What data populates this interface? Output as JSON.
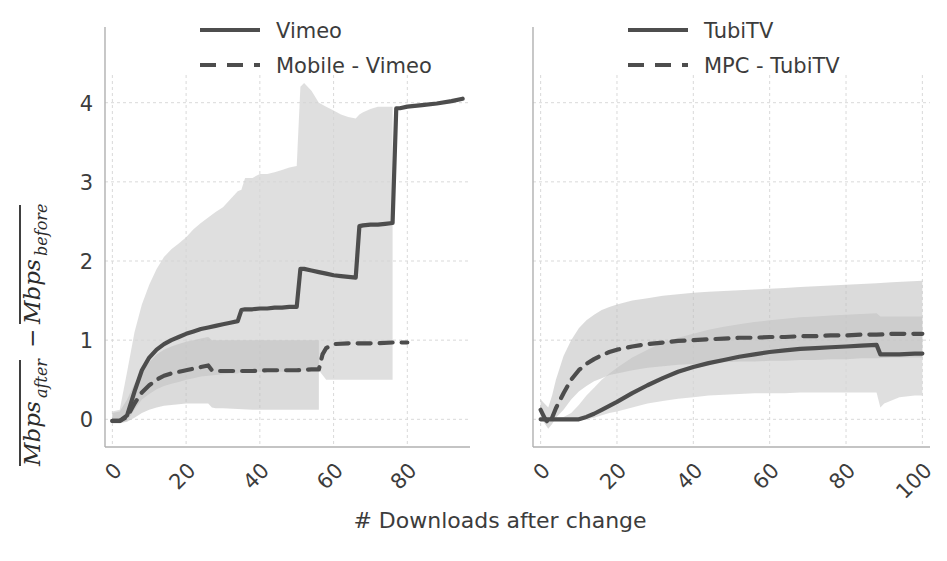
{
  "figure": {
    "background_color": "#ffffff",
    "panels": 2,
    "xlabel": "# Downloads after change",
    "ylabel_parts": {
      "term1_base": "Mbps",
      "term1_sub": "after",
      "operator": "−",
      "term2_base": "Mbps",
      "term2_sub": "before",
      "overline": true
    },
    "ylabel_plain": "Mbps_after - Mbps_before"
  },
  "style": {
    "line_color": "#4d4d4d",
    "band_color": "#d4d4d4",
    "band_color_dark": "#bdbdbd",
    "grid_color": "#d9d9d9",
    "spine_color": "#b0b0b0",
    "text_color": "#3c3c3c"
  },
  "chart_data": [
    {
      "type": "line",
      "panel": "left",
      "title": "",
      "xlabel": "# Downloads after change",
      "ylabel": "Mbps_after - Mbps_before",
      "xlim": [
        -2,
        97
      ],
      "ylim": [
        -0.35,
        4.35
      ],
      "xticks": [
        0,
        20,
        40,
        60,
        80
      ],
      "yticks": [
        0,
        1,
        2,
        3,
        4
      ],
      "xticklabels": [
        "0",
        "20",
        "40",
        "60",
        "80"
      ],
      "yticklabels": [
        "0",
        "1",
        "2",
        "3",
        "4"
      ],
      "grid": true,
      "legend_position": "upper left",
      "series": [
        {
          "name": "Vimeo",
          "style": "solid",
          "color": "#4d4d4d",
          "x": [
            0,
            2,
            4,
            6,
            8,
            10,
            12,
            14,
            16,
            18,
            20,
            22,
            24,
            26,
            28,
            30,
            32,
            34,
            35,
            36,
            38,
            40,
            42,
            44,
            46,
            48,
            50,
            51,
            52,
            54,
            56,
            58,
            60,
            62,
            64,
            66,
            67,
            68,
            70,
            72,
            74,
            76,
            77,
            78,
            80,
            84,
            88,
            92,
            95
          ],
          "y": [
            -0.02,
            -0.02,
            0.05,
            0.35,
            0.62,
            0.78,
            0.88,
            0.95,
            1.0,
            1.04,
            1.08,
            1.11,
            1.14,
            1.16,
            1.18,
            1.2,
            1.22,
            1.24,
            1.38,
            1.39,
            1.39,
            1.4,
            1.4,
            1.41,
            1.41,
            1.42,
            1.42,
            1.9,
            1.9,
            1.88,
            1.86,
            1.84,
            1.82,
            1.81,
            1.8,
            1.79,
            2.44,
            2.45,
            2.46,
            2.46,
            2.47,
            2.48,
            3.93,
            3.93,
            3.95,
            3.97,
            3.99,
            4.02,
            4.05
          ],
          "band_lower": [
            -0.05,
            -0.05,
            -0.02,
            0.12,
            0.25,
            0.32,
            0.38,
            0.42,
            0.45,
            0.47,
            0.5,
            0.52,
            0.54,
            0.55,
            0.56,
            0.57,
            0.58,
            0.58,
            0.6,
            0.6,
            0.6,
            0.6,
            0.6,
            0.6,
            0.6,
            0.6,
            0.6,
            0.62,
            0.62,
            0.62,
            0.62,
            0.5,
            0.5,
            0.5,
            0.5,
            0.5,
            0.5,
            0.5,
            0.5,
            0.5,
            0.5,
            0.5,
            null,
            null,
            null,
            null,
            null,
            null,
            null
          ],
          "band_upper": [
            0.1,
            0.12,
            0.6,
            1.1,
            1.45,
            1.7,
            1.9,
            2.05,
            2.15,
            2.22,
            2.3,
            2.4,
            2.48,
            2.55,
            2.62,
            2.68,
            2.78,
            2.88,
            2.9,
            3.05,
            3.05,
            3.1,
            3.1,
            3.12,
            3.15,
            3.18,
            3.2,
            4.2,
            4.25,
            4.15,
            4.0,
            3.95,
            3.9,
            3.85,
            3.82,
            3.8,
            3.85,
            3.88,
            3.92,
            3.95,
            3.95,
            3.95,
            null,
            null,
            null,
            null,
            null,
            null,
            null
          ]
        },
        {
          "name": "Mobile - Vimeo",
          "style": "dashed",
          "color": "#4d4d4d",
          "x": [
            0,
            2,
            4,
            6,
            8,
            10,
            12,
            14,
            16,
            18,
            20,
            22,
            24,
            26,
            27,
            28,
            30,
            34,
            38,
            42,
            46,
            50,
            54,
            56,
            57,
            58,
            60,
            64,
            68,
            72,
            76,
            80
          ],
          "y": [
            -0.02,
            -0.02,
            0.03,
            0.2,
            0.34,
            0.43,
            0.5,
            0.55,
            0.58,
            0.6,
            0.62,
            0.64,
            0.66,
            0.68,
            0.62,
            0.61,
            0.61,
            0.61,
            0.61,
            0.62,
            0.62,
            0.62,
            0.63,
            0.63,
            0.82,
            0.9,
            0.95,
            0.96,
            0.96,
            0.96,
            0.97,
            0.97
          ],
          "band_lower": [
            -0.05,
            -0.05,
            -0.03,
            0.02,
            0.08,
            0.12,
            0.15,
            0.17,
            0.18,
            0.19,
            0.2,
            0.2,
            0.2,
            0.2,
            0.15,
            0.14,
            0.14,
            0.13,
            0.12,
            0.12,
            0.12,
            0.12,
            0.12,
            0.12,
            null,
            null,
            null,
            null,
            null,
            null,
            null,
            null
          ],
          "band_upper": [
            0.08,
            0.1,
            0.25,
            0.45,
            0.6,
            0.72,
            0.82,
            0.88,
            0.92,
            0.95,
            0.98,
            1.0,
            1.02,
            1.04,
            1.0,
            1.0,
            1.0,
            1.0,
            1.0,
            1.0,
            1.0,
            1.0,
            1.0,
            1.0,
            null,
            null,
            null,
            null,
            null,
            null,
            null,
            null
          ]
        }
      ]
    },
    {
      "type": "line",
      "panel": "right",
      "title": "",
      "xlabel": "# Downloads after change",
      "ylabel": "Mbps_after - Mbps_before",
      "xlim": [
        -2,
        102
      ],
      "ylim": [
        -0.35,
        4.35
      ],
      "xticks": [
        0,
        20,
        40,
        60,
        80,
        100
      ],
      "yticks": [
        0,
        1,
        2,
        3,
        4
      ],
      "xticklabels": [
        "0",
        "20",
        "40",
        "60",
        "80",
        "100"
      ],
      "yticklabels": [
        "0",
        "1",
        "2",
        "3",
        "4"
      ],
      "grid": true,
      "legend_position": "upper left",
      "series": [
        {
          "name": "TubiTV",
          "style": "solid",
          "color": "#4d4d4d",
          "x": [
            0,
            2,
            4,
            6,
            8,
            10,
            12,
            14,
            16,
            18,
            20,
            24,
            28,
            32,
            36,
            40,
            44,
            48,
            52,
            56,
            60,
            64,
            68,
            72,
            76,
            80,
            84,
            88,
            89,
            90,
            94,
            98,
            100
          ],
          "y": [
            0.0,
            0.0,
            0.0,
            0.0,
            0.0,
            0.0,
            0.03,
            0.07,
            0.12,
            0.17,
            0.22,
            0.33,
            0.43,
            0.52,
            0.6,
            0.66,
            0.71,
            0.75,
            0.79,
            0.82,
            0.85,
            0.87,
            0.89,
            0.9,
            0.91,
            0.92,
            0.93,
            0.94,
            0.82,
            0.82,
            0.82,
            0.83,
            0.83
          ],
          "band_lower": [
            0.0,
            -0.02,
            -0.02,
            -0.02,
            -0.02,
            -0.02,
            0.0,
            0.02,
            0.05,
            0.08,
            0.1,
            0.15,
            0.2,
            0.23,
            0.26,
            0.28,
            0.3,
            0.31,
            0.32,
            0.33,
            0.33,
            0.33,
            0.34,
            0.34,
            0.34,
            0.34,
            0.34,
            0.34,
            0.15,
            0.2,
            0.28,
            0.3,
            0.3
          ],
          "band_upper": [
            0.02,
            0.02,
            0.02,
            0.03,
            0.08,
            0.18,
            0.3,
            0.4,
            0.5,
            0.58,
            0.65,
            0.78,
            0.88,
            0.97,
            1.03,
            1.08,
            1.13,
            1.17,
            1.2,
            1.23,
            1.25,
            1.27,
            1.29,
            1.3,
            1.31,
            1.32,
            1.33,
            1.34,
            1.3,
            1.3,
            1.3,
            1.3,
            1.3
          ]
        },
        {
          "name": "MPC - TubiTV",
          "style": "dashed",
          "color": "#4d4d4d",
          "x": [
            0,
            1,
            2,
            3,
            4,
            6,
            8,
            10,
            12,
            14,
            16,
            18,
            20,
            24,
            28,
            32,
            36,
            40,
            44,
            48,
            52,
            56,
            60,
            64,
            68,
            72,
            76,
            80,
            84,
            88,
            92,
            96,
            100
          ],
          "y": [
            0.12,
            0.02,
            -0.05,
            0.02,
            0.14,
            0.33,
            0.5,
            0.62,
            0.7,
            0.76,
            0.81,
            0.85,
            0.88,
            0.92,
            0.95,
            0.97,
            0.99,
            1.0,
            1.01,
            1.02,
            1.03,
            1.03,
            1.04,
            1.04,
            1.05,
            1.05,
            1.06,
            1.06,
            1.07,
            1.07,
            1.08,
            1.08,
            1.08
          ],
          "band_lower": [
            0.02,
            -0.05,
            -0.12,
            -0.06,
            0.02,
            0.12,
            0.25,
            0.35,
            0.42,
            0.48,
            0.52,
            0.56,
            0.58,
            0.62,
            0.65,
            0.67,
            0.69,
            0.7,
            0.71,
            0.72,
            0.73,
            0.73,
            0.74,
            0.74,
            0.75,
            0.75,
            0.76,
            0.76,
            0.77,
            0.77,
            0.78,
            0.78,
            0.78
          ],
          "band_upper": [
            0.25,
            0.2,
            0.15,
            0.3,
            0.5,
            0.8,
            1.0,
            1.15,
            1.25,
            1.32,
            1.38,
            1.42,
            1.45,
            1.5,
            1.53,
            1.56,
            1.58,
            1.6,
            1.61,
            1.62,
            1.63,
            1.64,
            1.65,
            1.66,
            1.67,
            1.68,
            1.69,
            1.7,
            1.71,
            1.72,
            1.73,
            1.74,
            1.75
          ]
        }
      ]
    }
  ],
  "legends": {
    "left": {
      "items": [
        {
          "label": "Vimeo",
          "style": "solid"
        },
        {
          "label": "Mobile - Vimeo",
          "style": "dashed"
        }
      ]
    },
    "right": {
      "items": [
        {
          "label": "TubiTV",
          "style": "solid"
        },
        {
          "label": "MPC - TubiTV",
          "style": "dashed"
        }
      ]
    }
  }
}
